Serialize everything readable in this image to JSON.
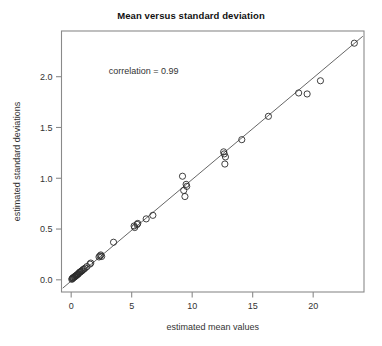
{
  "chart_data": {
    "type": "scatter",
    "title": "Mean versus standard deviation",
    "xlabel": "estimated mean values",
    "ylabel": "estimated standard deviations",
    "xlim": [
      -0.8,
      24.2
    ],
    "ylim": [
      -0.12,
      2.45
    ],
    "xticks": [
      0,
      5,
      10,
      15,
      20
    ],
    "xtick_labels": [
      "0",
      "5",
      "10",
      "15",
      "20"
    ],
    "yticks": [
      0.0,
      0.5,
      1.0,
      1.5,
      2.0
    ],
    "ytick_labels": [
      "0.0",
      "0.5",
      "1.0",
      "1.5",
      "2.0"
    ],
    "grid": false,
    "legend": null,
    "annotations": [
      {
        "name": "correlation-annotation",
        "text": "correlation = 0.99",
        "x": 3.1,
        "y": 2.03
      }
    ],
    "reference_line": {
      "name": "identity-fit-line",
      "type": "line",
      "slope": 0.1,
      "intercept": -0.012,
      "x_start": -0.7,
      "x_end": 24.1
    },
    "marker": {
      "shape": "open-circle",
      "radius_px": 3.1,
      "stroke": "#2b2b2b",
      "fill": "none"
    },
    "series": [
      {
        "name": "variance-mean-pairs",
        "points": [
          [
            0.05,
            0.005
          ],
          [
            0.09,
            0.012
          ],
          [
            0.12,
            0.015
          ],
          [
            0.16,
            0.02
          ],
          [
            0.2,
            0.022
          ],
          [
            0.26,
            0.028
          ],
          [
            0.3,
            0.032
          ],
          [
            0.34,
            0.035
          ],
          [
            0.4,
            0.04
          ],
          [
            0.44,
            0.045
          ],
          [
            0.5,
            0.05
          ],
          [
            0.55,
            0.055
          ],
          [
            0.6,
            0.06
          ],
          [
            0.66,
            0.07
          ],
          [
            0.72,
            0.075
          ],
          [
            0.78,
            0.08
          ],
          [
            0.84,
            0.085
          ],
          [
            0.9,
            0.09
          ],
          [
            0.97,
            0.1
          ],
          [
            1.05,
            0.105
          ],
          [
            1.15,
            0.115
          ],
          [
            1.3,
            0.13
          ],
          [
            1.55,
            0.155
          ],
          [
            1.62,
            0.165
          ],
          [
            2.3,
            0.225
          ],
          [
            2.38,
            0.235
          ],
          [
            2.45,
            0.245
          ],
          [
            2.52,
            0.23
          ],
          [
            3.5,
            0.37
          ],
          [
            5.2,
            0.53
          ],
          [
            5.25,
            0.515
          ],
          [
            5.45,
            0.545
          ],
          [
            5.5,
            0.555
          ],
          [
            6.2,
            0.6
          ],
          [
            6.75,
            0.635
          ],
          [
            9.2,
            1.02
          ],
          [
            9.3,
            0.88
          ],
          [
            9.5,
            0.94
          ],
          [
            9.55,
            0.92
          ],
          [
            9.4,
            0.82
          ],
          [
            12.6,
            1.26
          ],
          [
            12.65,
            1.24
          ],
          [
            12.75,
            1.21
          ],
          [
            12.7,
            1.14
          ],
          [
            14.1,
            1.38
          ],
          [
            16.3,
            1.61
          ],
          [
            18.8,
            1.84
          ],
          [
            19.5,
            1.83
          ],
          [
            20.6,
            1.96
          ],
          [
            23.4,
            2.33
          ]
        ]
      }
    ]
  }
}
